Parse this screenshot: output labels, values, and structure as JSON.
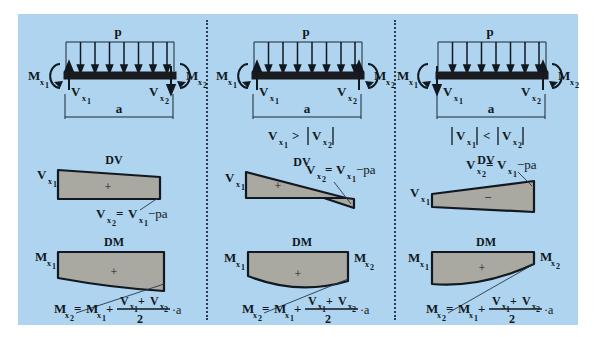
{
  "figure": {
    "background_color": "#aed4f0",
    "diagram_fill_color": "#a9a9a2",
    "beam_color": "#191b1f",
    "line_color": "#111820",
    "panel_count": 3
  },
  "labels": {
    "load": "p",
    "span": "a",
    "moment_left": "M",
    "moment_right": "M",
    "shear_left": "V",
    "shear_right": "V",
    "sub_x1": "x",
    "sub_x1_num": "1",
    "sub_x2": "x",
    "sub_x2_num": "2",
    "dv_title": "DV",
    "dm_title": "DM",
    "plus_sign": "+",
    "minus_sign": "−",
    "equals": "=",
    "v_formula_lhs": "V",
    "v_formula_rhs": "−pa",
    "m_formula_lhs": "M",
    "m_formula_mid": "+",
    "m_formula_denominator": "2",
    "m_formula_tail": "·a"
  },
  "panels": [
    {
      "id": "panel-left",
      "name": "case-both-shears-same-sign",
      "condition": "",
      "beam": {
        "load_label": "p",
        "span_label": "a",
        "arrow_count": 8,
        "left_shear_direction": "up",
        "right_shear_direction": "down",
        "left_moment_label": "M",
        "right_moment_label": "M",
        "left_shear_label": "V",
        "right_shear_label": "V"
      },
      "dv": {
        "title": "DV",
        "start_label": "V",
        "sign": "+",
        "shape": "trapezoid-positive",
        "formula": "V x2 = V x1 − pa",
        "formula_parts": {
          "lhs": "V",
          "lhs_sub": "x",
          "lhs_sub_num": "2",
          "eq": "=",
          "rhs": "V",
          "rhs_sub": "x",
          "rhs_sub_num": "1",
          "tail": "−pa"
        }
      },
      "dm": {
        "title": "DM",
        "start_label": "M",
        "end_label": "",
        "sign": "+",
        "shape": "parabola-top-flat",
        "formula": "M x2 = M x1 + (V x1 + V x2)/2 · a"
      }
    },
    {
      "id": "panel-middle",
      "name": "case-shear-changes-sign",
      "condition": "V x1 > | V x2 |",
      "condition_parts": {
        "a": "V",
        "a_sub": "x",
        "a_sub_num": "1",
        "op": ">",
        "b": "V",
        "b_sub": "x",
        "b_sub_num": "2"
      },
      "beam": {
        "load_label": "p",
        "span_label": "a",
        "arrow_count": 8,
        "left_shear_direction": "up",
        "right_shear_direction": "up",
        "left_moment_label": "M",
        "right_moment_label": "M",
        "left_shear_label": "V",
        "right_shear_label": "V"
      },
      "dv": {
        "title": "DV",
        "start_label": "V",
        "sign": "+",
        "shape": "crossing-zero-positive-dominant",
        "formula": "V x2 = V x1 − pa",
        "formula_parts": {
          "lhs": "V",
          "lhs_sub": "x",
          "lhs_sub_num": "2",
          "eq": "=",
          "rhs": "V",
          "rhs_sub": "x",
          "rhs_sub_num": "1",
          "tail": "−pa"
        }
      },
      "dm": {
        "title": "DM",
        "start_label": "M",
        "end_label": "M",
        "sign": "+",
        "shape": "parabola-max-interior",
        "formula": "M x2 = M x1 + (V x1 + V x2)/2 · a"
      }
    },
    {
      "id": "panel-right",
      "name": "case-both-shears-negative",
      "condition": "| V x1 | < | V x2 |",
      "condition_parts": {
        "a": "V",
        "a_sub": "x",
        "a_sub_num": "1",
        "op": "<",
        "b": "V",
        "b_sub": "x",
        "b_sub_num": "2"
      },
      "beam": {
        "load_label": "p",
        "span_label": "a",
        "arrow_count": 8,
        "left_shear_direction": "down",
        "right_shear_direction": "up",
        "left_moment_label": "M",
        "right_moment_label": "M",
        "left_shear_label": "V",
        "right_shear_label": "V"
      },
      "dv": {
        "title": "DV",
        "start_label": "V",
        "sign": "−",
        "shape": "trapezoid-negative",
        "formula": "V x2 = V x1 − pa",
        "formula_parts": {
          "lhs": "V",
          "lhs_sub": "x",
          "lhs_sub_num": "2",
          "eq": "=",
          "rhs": "V",
          "rhs_sub": "x",
          "rhs_sub_num": "1",
          "tail": "−pa"
        }
      },
      "dm": {
        "title": "DM",
        "start_label": "M",
        "end_label": "M",
        "sign": "+",
        "shape": "parabola-rising-right",
        "formula": "M x2 = M x1 + (V x1 + V x2)/2 · a"
      }
    }
  ]
}
